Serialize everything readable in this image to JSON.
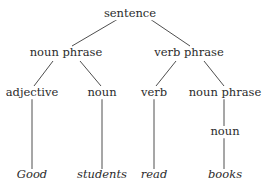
{
  "diagram": {
    "type": "parse-tree",
    "line_color": "#3a3a3a",
    "nodes": {
      "root": {
        "label": "sentence",
        "x": 130,
        "y": 14
      },
      "np1": {
        "label": "noun phrase",
        "x": 66,
        "y": 53
      },
      "vp": {
        "label": "verb phrase",
        "x": 189,
        "y": 53
      },
      "adj": {
        "label": "adjective",
        "x": 32,
        "y": 93
      },
      "n1": {
        "label": "noun",
        "x": 102,
        "y": 93
      },
      "v": {
        "label": "verb",
        "x": 154,
        "y": 93
      },
      "np2": {
        "label": "noun phrase",
        "x": 225,
        "y": 93
      },
      "n2": {
        "label": "noun",
        "x": 225,
        "y": 132
      },
      "w1": {
        "label": "Good",
        "x": 32,
        "y": 175
      },
      "w2": {
        "label": "students",
        "x": 102,
        "y": 175
      },
      "w3": {
        "label": "read",
        "x": 154,
        "y": 175
      },
      "w4": {
        "label": "books",
        "x": 225,
        "y": 175
      }
    },
    "edges": [
      [
        "root",
        "np1"
      ],
      [
        "root",
        "vp"
      ],
      [
        "np1",
        "adj"
      ],
      [
        "np1",
        "n1"
      ],
      [
        "vp",
        "v"
      ],
      [
        "vp",
        "np2"
      ],
      [
        "adj",
        "w1"
      ],
      [
        "n1",
        "w2"
      ],
      [
        "v",
        "w3"
      ],
      [
        "np2",
        "n2"
      ],
      [
        "n2",
        "w4"
      ]
    ]
  }
}
